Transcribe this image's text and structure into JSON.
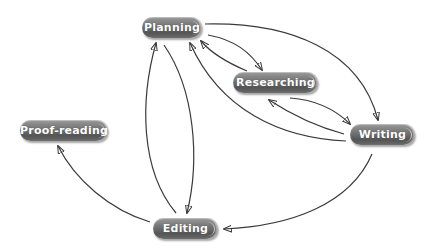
{
  "diagram": {
    "type": "cycle-flow",
    "nodes": [
      {
        "id": "planning",
        "label": "Planning"
      },
      {
        "id": "researching",
        "label": "Researching"
      },
      {
        "id": "writing",
        "label": "Writing"
      },
      {
        "id": "proofreading",
        "label": "Proof-reading"
      },
      {
        "id": "editing",
        "label": "Editing"
      }
    ],
    "edges": [
      {
        "from": "planning",
        "to": "researching"
      },
      {
        "from": "researching",
        "to": "planning"
      },
      {
        "from": "planning",
        "to": "writing"
      },
      {
        "from": "researching",
        "to": "writing"
      },
      {
        "from": "writing",
        "to": "researching"
      },
      {
        "from": "writing",
        "to": "planning"
      },
      {
        "from": "writing",
        "to": "editing"
      },
      {
        "from": "editing",
        "to": "planning"
      },
      {
        "from": "planning",
        "to": "editing"
      },
      {
        "from": "editing",
        "to": "proofreading"
      }
    ],
    "colors": {
      "node_fill": "#6e6e6e",
      "node_text": "#ffffff",
      "edge": "#3a3a3a",
      "background": "#ffffff"
    }
  }
}
